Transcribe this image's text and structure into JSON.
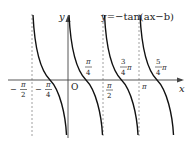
{
  "diagram": {
    "equation": "y=−tan(ax−b)",
    "axis_labels": {
      "x": "x",
      "y": "y",
      "origin": "O"
    },
    "tick_labels": [
      {
        "id": "neg_half_pi",
        "num": "π",
        "den": "2",
        "sign": "−",
        "suffix": ""
      },
      {
        "id": "neg_quarter_pi",
        "num": "π",
        "den": "4",
        "sign": "−",
        "suffix": ""
      },
      {
        "id": "quarter_pi",
        "num": "π",
        "den": "4",
        "sign": "",
        "suffix": ""
      },
      {
        "id": "half_pi",
        "num": "π",
        "den": "2",
        "sign": "",
        "suffix": ""
      },
      {
        "id": "three_quarter_pi",
        "num": "3",
        "den": "4",
        "sign": "",
        "suffix": "π"
      },
      {
        "id": "pi",
        "text": "π"
      },
      {
        "id": "five_quarter_pi",
        "num": "5",
        "den": "4",
        "sign": "",
        "suffix": "π"
      }
    ],
    "asymptotes": [
      "-π/2",
      "π/2",
      "π"
    ],
    "zeros": [
      "-π/4",
      "π/4",
      "3π/4",
      "5π/4"
    ],
    "period": "π/2",
    "colors": {
      "curve": "#111111",
      "axis": "#444444",
      "dashed": "#888888"
    }
  }
}
